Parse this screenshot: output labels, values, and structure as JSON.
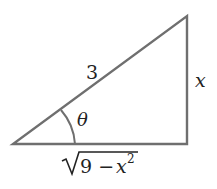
{
  "diagram": {
    "type": "right-triangle",
    "labels": {
      "hypotenuse": "3",
      "opposite": "x",
      "angle": "θ",
      "adjacent_radicand_a": "9 − ",
      "adjacent_var": "x",
      "adjacent_exp": "2"
    },
    "colors": {
      "stroke": "#6f6f6f",
      "text": "#222222",
      "background": "#ffffff"
    }
  }
}
